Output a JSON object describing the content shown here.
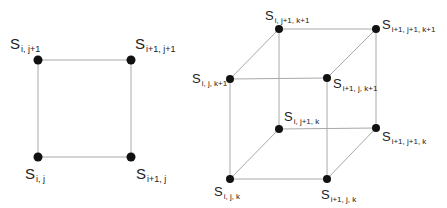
{
  "diagram_2d": {
    "symbol": "S",
    "nodes": [
      {
        "id": "s_i_j1",
        "sub": "i, j+1",
        "x": 38,
        "y": 60
      },
      {
        "id": "s_i1_j1",
        "sub": "i+1, j+1",
        "x": 131,
        "y": 60
      },
      {
        "id": "s_i_j",
        "sub": "i, j",
        "x": 38,
        "y": 157
      },
      {
        "id": "s_i1_j",
        "sub": "i+1, j",
        "x": 131,
        "y": 157
      }
    ],
    "edges": [
      [
        "s_i_j1",
        "s_i1_j1"
      ],
      [
        "s_i1_j1",
        "s_i1_j"
      ],
      [
        "s_i1_j",
        "s_i_j"
      ],
      [
        "s_i_j",
        "s_i_j1"
      ]
    ]
  },
  "diagram_3d": {
    "symbol": "S",
    "nodes": [
      {
        "id": "s_i_j1_k1",
        "sub": "i, j+1, k+1",
        "x": 279,
        "y": 29
      },
      {
        "id": "s_i1_j1_k1",
        "sub": "i+1, j+1, k+1",
        "x": 376,
        "y": 29
      },
      {
        "id": "s_i_j_k1",
        "sub": "i, j, k+1",
        "x": 230,
        "y": 79
      },
      {
        "id": "s_i1_j_k1",
        "sub": "i+1, j, k+1",
        "x": 327,
        "y": 78
      },
      {
        "id": "s_i_j1_k",
        "sub": "i, j+1, k",
        "x": 279,
        "y": 129
      },
      {
        "id": "s_i1_j1_k",
        "sub": "i+1, j+1, k",
        "x": 376,
        "y": 128
      },
      {
        "id": "s_i_j_k",
        "sub": "i, j, k",
        "x": 230,
        "y": 179
      },
      {
        "id": "s_i1_j_k",
        "sub": "i+1, j, k",
        "x": 327,
        "y": 179
      }
    ]
  }
}
